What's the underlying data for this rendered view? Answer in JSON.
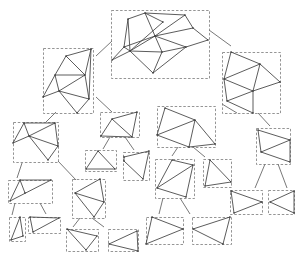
{
  "diagram": {
    "type": "hierarchical-mesh-decomposition-tree",
    "colors": {
      "background": "#ffffff",
      "edge": "#4a4a4a",
      "box": "#7a7a7a",
      "connector": "#555555"
    },
    "nodes": [
      {
        "id": "root",
        "box": [
          111,
          10,
          98,
          68
        ],
        "verts": [
          [
            112,
            60
          ],
          [
            124,
            47
          ],
          [
            128,
            19
          ],
          [
            145,
            13
          ],
          [
            163,
            22
          ],
          [
            130,
            51
          ],
          [
            155,
            36
          ],
          [
            185,
            15
          ],
          [
            193,
            28
          ],
          [
            208,
            40
          ],
          [
            186,
            47
          ],
          [
            162,
            52
          ],
          [
            153,
            73
          ]
        ],
        "edges": [
          [
            0,
            1
          ],
          [
            1,
            2
          ],
          [
            2,
            3
          ],
          [
            3,
            4
          ],
          [
            4,
            5
          ],
          [
            1,
            5
          ],
          [
            2,
            5
          ],
          [
            5,
            6
          ],
          [
            3,
            6
          ],
          [
            6,
            7
          ],
          [
            3,
            7
          ],
          [
            7,
            8
          ],
          [
            8,
            9
          ],
          [
            9,
            10
          ],
          [
            6,
            10
          ],
          [
            6,
            8
          ],
          [
            10,
            11
          ],
          [
            6,
            11
          ],
          [
            5,
            11
          ],
          [
            0,
            5
          ],
          [
            11,
            12
          ],
          [
            5,
            12
          ],
          [
            10,
            12
          ],
          [
            1,
            6
          ]
        ]
      },
      {
        "id": "l1-left",
        "box": [
          43,
          48,
          50,
          65
        ],
        "verts": [
          [
            66,
            56
          ],
          [
            91,
            49
          ],
          [
            55,
            75
          ],
          [
            85,
            75
          ],
          [
            59,
            91
          ],
          [
            43,
            97
          ],
          [
            89,
            99
          ],
          [
            77,
            113
          ]
        ],
        "edges": [
          [
            0,
            1
          ],
          [
            0,
            2
          ],
          [
            0,
            3
          ],
          [
            1,
            3
          ],
          [
            2,
            3
          ],
          [
            2,
            4
          ],
          [
            3,
            4
          ],
          [
            4,
            5
          ],
          [
            2,
            5
          ],
          [
            4,
            6
          ],
          [
            3,
            6
          ],
          [
            1,
            6
          ],
          [
            4,
            7
          ],
          [
            6,
            7
          ]
        ]
      },
      {
        "id": "l1-right",
        "box": [
          222,
          52,
          58,
          61
        ],
        "verts": [
          [
            231,
            52
          ],
          [
            260,
            64
          ],
          [
            224,
            79
          ],
          [
            280,
            82
          ],
          [
            253,
            91
          ],
          [
            227,
            101
          ],
          [
            253,
            113
          ]
        ],
        "edges": [
          [
            0,
            1
          ],
          [
            0,
            2
          ],
          [
            1,
            2
          ],
          [
            1,
            3
          ],
          [
            2,
            4
          ],
          [
            3,
            4
          ],
          [
            1,
            4
          ],
          [
            2,
            5
          ],
          [
            4,
            5
          ],
          [
            4,
            6
          ],
          [
            5,
            6
          ]
        ]
      },
      {
        "id": "l2a",
        "box": [
          13,
          122,
          45,
          40
        ],
        "verts": [
          [
            24,
            123
          ],
          [
            55,
            123
          ],
          [
            13,
            143
          ],
          [
            29,
            136
          ],
          [
            58,
            146
          ],
          [
            48,
            160
          ]
        ],
        "edges": [
          [
            0,
            1
          ],
          [
            0,
            2
          ],
          [
            0,
            3
          ],
          [
            1,
            3
          ],
          [
            2,
            3
          ],
          [
            3,
            4
          ],
          [
            1,
            4
          ],
          [
            3,
            5
          ],
          [
            4,
            5
          ]
        ]
      },
      {
        "id": "l2b",
        "box": [
          100,
          112,
          39,
          25
        ],
        "verts": [
          [
            112,
            119
          ],
          [
            137,
            112
          ],
          [
            101,
            136
          ],
          [
            132,
            137
          ]
        ],
        "edges": [
          [
            0,
            1
          ],
          [
            0,
            2
          ],
          [
            0,
            3
          ],
          [
            1,
            3
          ],
          [
            2,
            3
          ]
        ]
      },
      {
        "id": "l2c",
        "box": [
          157,
          106,
          58,
          41
        ],
        "verts": [
          [
            165,
            108
          ],
          [
            195,
            120
          ],
          [
            157,
            135
          ],
          [
            215,
            144
          ],
          [
            189,
            147
          ]
        ],
        "edges": [
          [
            0,
            1
          ],
          [
            0,
            2
          ],
          [
            1,
            3
          ],
          [
            1,
            2
          ],
          [
            1,
            4
          ],
          [
            2,
            4
          ],
          [
            3,
            4
          ]
        ]
      },
      {
        "id": "l2d",
        "box": [
          256,
          128,
          34,
          36
        ],
        "verts": [
          [
            258,
            130
          ],
          [
            290,
            140
          ],
          [
            261,
            152
          ],
          [
            290,
            162
          ]
        ],
        "edges": [
          [
            0,
            1
          ],
          [
            0,
            2
          ],
          [
            1,
            2
          ],
          [
            2,
            3
          ],
          [
            1,
            3
          ]
        ]
      },
      {
        "id": "l3a",
        "box": [
          85,
          150,
          31,
          21
        ],
        "verts": [
          [
            98,
            151
          ],
          [
            86,
            169
          ],
          [
            115,
            169
          ]
        ],
        "edges": [
          [
            0,
            1
          ],
          [
            0,
            2
          ],
          [
            1,
            2
          ]
        ]
      },
      {
        "id": "l3b",
        "box": [
          123,
          152,
          26,
          28
        ],
        "verts": [
          [
            124,
            157
          ],
          [
            149,
            151
          ],
          [
            124,
            161
          ],
          [
            143,
            179
          ]
        ],
        "edges": [
          [
            0,
            1
          ],
          [
            2,
            3
          ],
          [
            1,
            3
          ],
          [
            0,
            2
          ]
        ]
      },
      {
        "id": "l3c",
        "box": [
          8,
          180,
          44,
          23
        ],
        "verts": [
          [
            20,
            180
          ],
          [
            51,
            180
          ],
          [
            10,
            201
          ],
          [
            25,
            193
          ]
        ],
        "edges": [
          [
            0,
            1
          ],
          [
            0,
            2
          ],
          [
            2,
            1
          ],
          [
            0,
            3
          ]
        ]
      },
      {
        "id": "l3d",
        "box": [
          72,
          179,
          33,
          39
        ],
        "verts": [
          [
            100,
            179
          ],
          [
            75,
            193
          ],
          [
            104,
            202
          ],
          [
            94,
            217
          ]
        ],
        "edges": [
          [
            0,
            1
          ],
          [
            1,
            2
          ],
          [
            0,
            2
          ],
          [
            1,
            3
          ],
          [
            2,
            3
          ]
        ]
      },
      {
        "id": "l3e",
        "box": [
          155,
          159,
          39,
          39
        ],
        "verts": [
          [
            172,
            160
          ],
          [
            193,
            165
          ],
          [
            157,
            188
          ],
          [
            186,
            197
          ]
        ],
        "edges": [
          [
            0,
            1
          ],
          [
            0,
            2
          ],
          [
            1,
            2
          ],
          [
            2,
            3
          ],
          [
            1,
            3
          ]
        ]
      },
      {
        "id": "l3f",
        "box": [
          203,
          159,
          28,
          28
        ],
        "verts": [
          [
            210,
            160
          ],
          [
            231,
            182
          ],
          [
            205,
            186
          ]
        ],
        "edges": [
          [
            0,
            1
          ],
          [
            0,
            2
          ],
          [
            1,
            2
          ]
        ]
      },
      {
        "id": "l3g",
        "box": [
          230,
          190,
          32,
          24
        ],
        "verts": [
          [
            231,
            191
          ],
          [
            262,
            202
          ],
          [
            234,
            213
          ]
        ],
        "edges": [
          [
            0,
            1
          ],
          [
            1,
            2
          ],
          [
            0,
            2
          ]
        ]
      },
      {
        "id": "l3h",
        "box": [
          268,
          190,
          26,
          24
        ],
        "verts": [
          [
            294,
            191
          ],
          [
            270,
            202
          ],
          [
            294,
            213
          ]
        ],
        "edges": [
          [
            0,
            1
          ],
          [
            1,
            2
          ],
          [
            0,
            2
          ]
        ]
      },
      {
        "id": "l4a",
        "box": [
          9,
          217,
          16,
          24
        ],
        "verts": [
          [
            20,
            217
          ],
          [
            23,
            236
          ],
          [
            11,
            240
          ]
        ],
        "edges": [
          [
            0,
            1
          ],
          [
            1,
            2
          ],
          [
            0,
            2
          ]
        ]
      },
      {
        "id": "l4b",
        "box": [
          28,
          217,
          32,
          16
        ],
        "verts": [
          [
            30,
            217
          ],
          [
            59,
            218
          ],
          [
            33,
            232
          ]
        ],
        "edges": [
          [
            0,
            1
          ],
          [
            1,
            2
          ],
          [
            0,
            2
          ]
        ]
      },
      {
        "id": "l4c",
        "box": [
          66,
          229,
          32,
          22
        ],
        "verts": [
          [
            67,
            229
          ],
          [
            97,
            236
          ],
          [
            86,
            250
          ]
        ],
        "edges": [
          [
            0,
            1
          ],
          [
            1,
            2
          ],
          [
            0,
            2
          ]
        ]
      },
      {
        "id": "l4d",
        "box": [
          108,
          229,
          30,
          22
        ],
        "verts": [
          [
            137,
            231
          ],
          [
            109,
            244
          ],
          [
            138,
            251
          ]
        ],
        "edges": [
          [
            0,
            1
          ],
          [
            1,
            2
          ],
          [
            0,
            2
          ]
        ]
      },
      {
        "id": "l4e",
        "box": [
          146,
          217,
          37,
          27
        ],
        "verts": [
          [
            152,
            217
          ],
          [
            183,
            229
          ],
          [
            146,
            244
          ]
        ],
        "edges": [
          [
            0,
            1
          ],
          [
            1,
            2
          ],
          [
            0,
            2
          ]
        ]
      },
      {
        "id": "l4f",
        "box": [
          192,
          217,
          39,
          27
        ],
        "verts": [
          [
            230,
            217
          ],
          [
            193,
            229
          ],
          [
            223,
            244
          ]
        ],
        "edges": [
          [
            0,
            1
          ],
          [
            1,
            2
          ],
          [
            0,
            2
          ]
        ]
      }
    ],
    "connectors": [
      [
        112,
        41,
        96,
        56
      ],
      [
        209,
        30,
        231,
        46
      ],
      [
        56,
        112,
        46,
        122
      ],
      [
        96,
        97,
        112,
        112
      ],
      [
        237,
        113,
        222,
        104
      ],
      [
        258,
        113,
        270,
        126
      ],
      [
        110,
        137,
        103,
        149
      ],
      [
        125,
        137,
        134,
        150
      ],
      [
        22,
        163,
        17,
        178
      ],
      [
        58,
        161,
        76,
        180
      ],
      [
        265,
        164,
        255,
        188
      ],
      [
        278,
        164,
        287,
        188
      ],
      [
        178,
        147,
        172,
        156
      ],
      [
        193,
        147,
        205,
        157
      ],
      [
        15,
        203,
        12,
        215
      ],
      [
        40,
        203,
        46,
        214
      ],
      [
        80,
        218,
        73,
        227
      ],
      [
        92,
        218,
        104,
        227
      ],
      [
        163,
        198,
        159,
        214
      ],
      [
        180,
        198,
        190,
        214
      ]
    ]
  }
}
